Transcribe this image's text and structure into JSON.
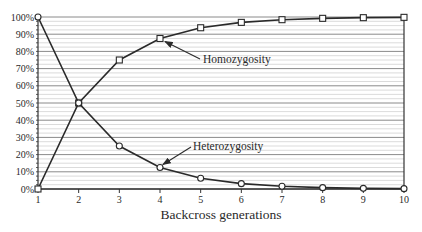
{
  "chart_data": {
    "type": "line",
    "title": "",
    "xlabel": "Backcross generations",
    "ylabel": "",
    "x": [
      1,
      2,
      3,
      4,
      5,
      6,
      7,
      8,
      9,
      10
    ],
    "x_tick_labels": [
      "1",
      "2",
      "3",
      "4",
      "5",
      "6",
      "7",
      "8",
      "9",
      "10"
    ],
    "y_tick_labels": [
      "0%",
      "10%",
      "20%",
      "30%",
      "40%",
      "50%",
      "60%",
      "70%",
      "80%",
      "90%",
      "100%"
    ],
    "xlim": [
      1,
      10
    ],
    "ylim": [
      0,
      100
    ],
    "grid": true,
    "minor_grid_step": 2.5,
    "series": [
      {
        "name": "Homozygosity",
        "marker": "square",
        "values": [
          0,
          50,
          75,
          87.5,
          93.75,
          96.875,
          98.44,
          99.22,
          99.61,
          99.8
        ]
      },
      {
        "name": "Heterozygosity",
        "marker": "circle",
        "values": [
          100,
          50,
          25,
          12.5,
          6.25,
          3.125,
          1.56,
          0.78,
          0.39,
          0.2
        ]
      }
    ],
    "annotations": [
      {
        "text": "Homozygosity",
        "series": "Homozygosity",
        "points_to_x": 4
      },
      {
        "text": "Heterozygosity",
        "series": "Heterozygosity",
        "points_to_x": 4
      }
    ],
    "legend": "none"
  }
}
